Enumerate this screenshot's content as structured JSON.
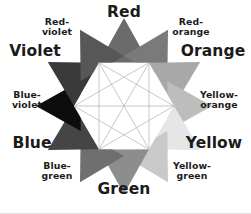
{
  "diagram": {
    "type": "color-wheel-star",
    "background": "#ffffff",
    "center": {
      "x": 124,
      "y": 106
    },
    "outer_radius": 88,
    "inner_radius": 50,
    "hexagon_fill": "#ffffff",
    "line_color": "#b9b9b9",
    "points": [
      {
        "name": "red",
        "label": "Red",
        "angle": -90,
        "tier": "primary",
        "fill": "#6b6b6b",
        "label_class": "major"
      },
      {
        "name": "red-orange",
        "label": "Red-\norange",
        "angle": -60,
        "tier": "tertiary",
        "fill": "#7a7a7a",
        "label_class": "minor"
      },
      {
        "name": "orange",
        "label": "Orange",
        "angle": -30,
        "tier": "secondary",
        "fill": "#a8a8a8",
        "label_class": "major"
      },
      {
        "name": "yellow-orange",
        "label": "Yellow-\norange",
        "angle": 0,
        "tier": "tertiary",
        "fill": "#bdbdbd",
        "label_class": "minor"
      },
      {
        "name": "yellow",
        "label": "Yellow",
        "angle": 30,
        "tier": "primary",
        "fill": "#e6e6e6",
        "label_class": "major"
      },
      {
        "name": "yellow-green",
        "label": "Yellow-\ngreen",
        "angle": 60,
        "tier": "tertiary",
        "fill": "#c9c9c9",
        "label_class": "minor"
      },
      {
        "name": "green",
        "label": "Green",
        "angle": 90,
        "tier": "secondary",
        "fill": "#8d8d8d",
        "label_class": "major"
      },
      {
        "name": "blue-green",
        "label": "Blue-\ngreen",
        "angle": 120,
        "tier": "tertiary",
        "fill": "#6f6f6f",
        "label_class": "minor"
      },
      {
        "name": "blue",
        "label": "Blue",
        "angle": 150,
        "tier": "primary",
        "fill": "#454545",
        "label_class": "major"
      },
      {
        "name": "blue-violet",
        "label": "Blue-\nviolet",
        "angle": 180,
        "tier": "tertiary",
        "fill": "#0d0d0d",
        "label_class": "minor"
      },
      {
        "name": "violet",
        "label": "Violet",
        "angle": 210,
        "tier": "secondary",
        "fill": "#3a3a3a",
        "label_class": "major"
      },
      {
        "name": "red-violet",
        "label": "Red-\nviolet",
        "angle": 240,
        "tier": "tertiary",
        "fill": "#575757",
        "label_class": "minor"
      }
    ],
    "labels": {
      "red": {
        "text": "Red",
        "x": 124,
        "y": 12,
        "size": "major"
      },
      "red_orange": {
        "text": "Red-\norange",
        "x": 191,
        "y": 27,
        "size": "minor"
      },
      "orange": {
        "text": "Orange",
        "x": 213,
        "y": 51,
        "size": "major"
      },
      "yellow_orange": {
        "text": "Yellow-\norange",
        "x": 219,
        "y": 100,
        "size": "minor"
      },
      "yellow": {
        "text": "Yellow",
        "x": 214,
        "y": 143,
        "size": "major"
      },
      "yellow_green": {
        "text": "Yellow-\ngreen",
        "x": 192,
        "y": 171,
        "size": "minor"
      },
      "green": {
        "text": "Green",
        "x": 124,
        "y": 189,
        "size": "major"
      },
      "blue_green": {
        "text": "Blue-\ngreen",
        "x": 57,
        "y": 171,
        "size": "minor"
      },
      "blue": {
        "text": "Blue",
        "x": 32,
        "y": 143,
        "size": "major"
      },
      "blue_violet": {
        "text": "Blue-\nviolet",
        "x": 27,
        "y": 100,
        "size": "minor"
      },
      "violet": {
        "text": "Violet",
        "x": 35,
        "y": 51,
        "size": "major"
      },
      "red_violet": {
        "text": "Red-\nviolet",
        "x": 57,
        "y": 27,
        "size": "minor"
      }
    }
  }
}
